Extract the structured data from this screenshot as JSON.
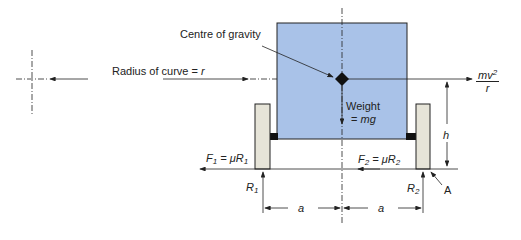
{
  "diagram": {
    "colors": {
      "body": "#a9c2e8",
      "wheel": "#e6e4d8",
      "line": "#222222"
    },
    "labels": {
      "centre_of_gravity": "Centre of gravity",
      "radius": "Radius of curve = ",
      "radius_var": "r",
      "centripetal_num": "mv",
      "centripetal_exp": "2",
      "centripetal_den": "r",
      "weight": "Weight",
      "weight_eq": "= ",
      "weight_var": "mg",
      "f1": "F",
      "f1_sub": "1",
      "f1_eq": " = μR",
      "f1_sub2": "1",
      "f2": "F",
      "f2_sub": "2",
      "f2_eq": " = μR",
      "f2_sub2": "2",
      "r1": "R",
      "r1_sub": "1",
      "r2": "R",
      "r2_sub": "2",
      "h": "h",
      "a_left": "a",
      "a_right": "a",
      "point_a": "A"
    }
  }
}
